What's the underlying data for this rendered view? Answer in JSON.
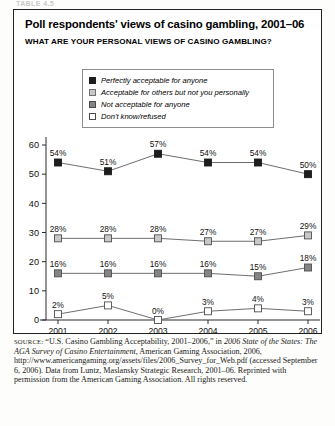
{
  "cutoff_header": "TABLE 4.5",
  "figure": {
    "title": "Poll respondents' views of casino gambling, 2001–06",
    "subtitle": "WHAT ARE YOUR PERSONAL VIEWS OF CASINO GAMBLING?"
  },
  "legend": {
    "items": [
      {
        "label": "Perfectly acceptable for anyone",
        "swatch": "black-square-marker"
      },
      {
        "label": "Acceptable for others but not you personally",
        "swatch": "light-gray-square-marker"
      },
      {
        "label": "Not acceptable for anyone",
        "swatch": "dark-gray-square-marker"
      },
      {
        "label": "Don't know/refused",
        "swatch": "white-square-marker"
      }
    ]
  },
  "source": {
    "label": "SOURCE:",
    "line1": " “U.S. Casino Gambling Acceptability, 2001–2006,” in ",
    "italic1": "2006 State of the States: The AGA Survey of Casino Entertainment,",
    "line2": " American Gaming Association, 2006, http://www.americangaming.org/assets/files/2006_Survey_for_Web.pdf (accessed September 6, 2006). Data from Luntz, Maslansky Strategic Research, 2001–06. Reprinted with permission from the American Gaming Association. All rights reserved."
  },
  "chart_data": {
    "type": "line",
    "title": "Poll respondents' views of casino gambling, 2001–06",
    "subtitle": "WHAT ARE YOUR PERSONAL VIEWS OF CASINO GAMBLING?",
    "xlabel": "",
    "ylabel": "",
    "categories": [
      "2001",
      "2002",
      "2003",
      "2004",
      "2005",
      "2006"
    ],
    "ylim": [
      0,
      60
    ],
    "yticks": [
      0,
      10,
      20,
      30,
      40,
      50,
      60
    ],
    "grid": false,
    "legend_position": "top-center",
    "value_labels_suffix": "%",
    "series": [
      {
        "name": "Perfectly acceptable for anyone",
        "color": "#1d1d1d",
        "marker": "filled-square",
        "values": [
          54,
          51,
          57,
          54,
          54,
          50
        ],
        "labels": [
          "54%",
          "51%",
          "57%",
          "54%",
          "54%",
          "50%"
        ]
      },
      {
        "name": "Acceptable for others but not you personally",
        "color": "#c8c8c8",
        "marker": "light-gray-square",
        "values": [
          28,
          28,
          28,
          27,
          27,
          29
        ],
        "labels": [
          "28%",
          "28%",
          "28%",
          "27%",
          "27%",
          "29%"
        ]
      },
      {
        "name": "Not acceptable for anyone",
        "color": "#848484",
        "marker": "dark-gray-square",
        "values": [
          16,
          16,
          16,
          16,
          15,
          18
        ],
        "labels": [
          "16%",
          "16%",
          "16%",
          "16%",
          "15%",
          "18%"
        ]
      },
      {
        "name": "Don't know/refused",
        "color": "#ffffff",
        "marker": "open-square",
        "values": [
          2,
          5,
          0,
          3,
          4,
          3
        ],
        "labels": [
          "2%",
          "5%",
          "0%",
          "3%",
          "4%",
          "3%"
        ]
      }
    ]
  }
}
